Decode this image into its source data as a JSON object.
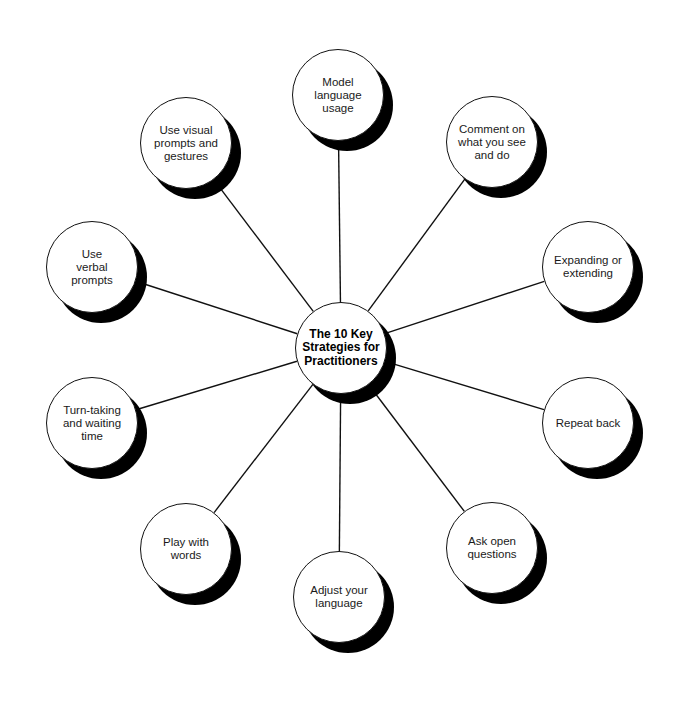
{
  "diagram": {
    "type": "hub-and-spoke",
    "colors": {
      "background": "#ffffff",
      "line": "#111111",
      "shadow": "#000000",
      "disc": "#ffffff",
      "text": "#1a1a1a"
    },
    "hub": {
      "label": "The 10 Key\nStrategies for\nPractitioners",
      "cx": 341,
      "cy": 348
    },
    "nodes": [
      {
        "id": "model-language-usage",
        "label": "Model\nlanguage\nusage",
        "cx": 338,
        "cy": 95
      },
      {
        "id": "comment-on-what-you-see",
        "label": "Comment on\nwhat you see\nand do",
        "cx": 492,
        "cy": 142
      },
      {
        "id": "expanding-or-extending",
        "label": "Expanding or\nextending",
        "cx": 588,
        "cy": 267
      },
      {
        "id": "repeat-back",
        "label": "Repeat back",
        "cx": 588,
        "cy": 423
      },
      {
        "id": "ask-open-questions",
        "label": "Ask open\nquestions",
        "cx": 492,
        "cy": 548
      },
      {
        "id": "adjust-your-language",
        "label": "Adjust your\nlanguage",
        "cx": 339,
        "cy": 597
      },
      {
        "id": "play-with-words",
        "label": "Play with\nwords",
        "cx": 186,
        "cy": 549
      },
      {
        "id": "turn-taking-and-waiting-time",
        "label": "Turn-taking\nand waiting\ntime",
        "cx": 92,
        "cy": 423
      },
      {
        "id": "use-verbal-prompts",
        "label": "Use\nverbal\nprompts",
        "cx": 92,
        "cy": 267
      },
      {
        "id": "use-visual-prompts-and-gestures",
        "label": "Use visual\nprompts and\ngestures",
        "cx": 186,
        "cy": 143
      }
    ]
  }
}
